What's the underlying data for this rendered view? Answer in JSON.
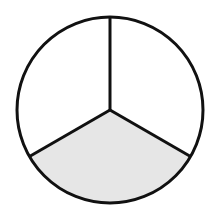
{
  "diagram": {
    "type": "fraction-circle",
    "total_parts": 3,
    "shaded_parts": 1,
    "fraction": "1/3",
    "colors": {
      "background": "#ffffff",
      "stroke": "#111111",
      "shaded_fill": "#e6e6e6",
      "unshaded_fill": "#ffffff"
    },
    "sectors": [
      {
        "name": "upper-right",
        "shaded": false
      },
      {
        "name": "upper-left",
        "shaded": false
      },
      {
        "name": "bottom",
        "shaded": true
      }
    ]
  }
}
